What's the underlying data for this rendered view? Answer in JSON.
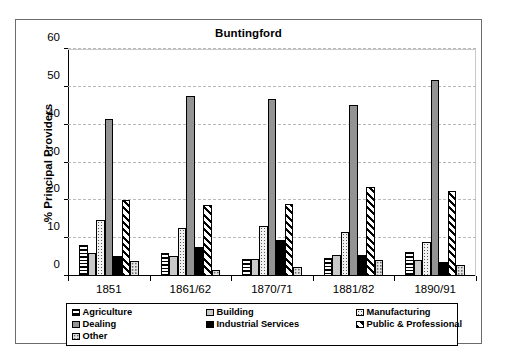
{
  "chart_data": {
    "type": "bar",
    "title": "Buntingford",
    "xlabel": "",
    "ylabel": "% Principal Providers",
    "ylim": [
      0,
      60
    ],
    "yticks": [
      0,
      10,
      20,
      30,
      40,
      50,
      60
    ],
    "grid": true,
    "legend_position": "bottom",
    "categories": [
      "1851",
      "1861/62",
      "1870/71",
      "1881/82",
      "1890/91"
    ],
    "series": [
      {
        "name": "Agriculture",
        "pattern": "horizontal-stripes",
        "values": [
          8.2,
          6.1,
          4.4,
          4.8,
          6.3
        ]
      },
      {
        "name": "Building",
        "pattern": "light-gray",
        "values": [
          6.1,
          5.4,
          4.4,
          5.5,
          4.2
        ]
      },
      {
        "name": "Manufacturing",
        "pattern": "dotted",
        "values": [
          14.8,
          12.6,
          13.2,
          11.6,
          9.1
        ]
      },
      {
        "name": "Dealing",
        "pattern": "medium-gray",
        "values": [
          41.5,
          47.5,
          46.8,
          45.2,
          51.8
        ]
      },
      {
        "name": "Industrial Services",
        "pattern": "solid-black",
        "values": [
          5.4,
          7.7,
          9.5,
          5.6,
          3.6
        ]
      },
      {
        "name": "Public & Professional",
        "pattern": "diagonal-hatch",
        "values": [
          20.1,
          18.8,
          19.0,
          23.4,
          22.5
        ]
      },
      {
        "name": "Other",
        "pattern": "fine-dots",
        "values": [
          4.1,
          1.5,
          2.4,
          4.2,
          2.8
        ]
      }
    ]
  },
  "legend": {
    "items": [
      {
        "label": "Agriculture"
      },
      {
        "label": "Building"
      },
      {
        "label": "Manufacturing"
      },
      {
        "label": "Dealing"
      },
      {
        "label": "Industrial Services"
      },
      {
        "label": "Public & Professional"
      },
      {
        "label": "Other"
      }
    ]
  },
  "colors": {
    "axis": "#000000",
    "grid": "#b9b9b9",
    "frame": "#6b6b6b",
    "background": "#ffffff"
  }
}
